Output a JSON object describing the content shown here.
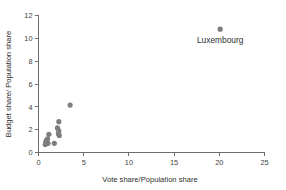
{
  "chart_data": {
    "type": "scatter",
    "title": "",
    "xlabel": "Vote share/Population share",
    "ylabel": "Budget share/ Population share",
    "xlim": [
      0,
      25
    ],
    "ylim": [
      0,
      12
    ],
    "xticks": [
      0,
      5,
      10,
      15,
      20,
      25
    ],
    "yticks": [
      0,
      2,
      4,
      6,
      8,
      10,
      12
    ],
    "xtick_labels": [
      "0",
      "5",
      "10",
      "15",
      "20",
      "25"
    ],
    "ytick_labels": [
      "0",
      "2",
      "4",
      "6",
      "8",
      "10",
      "12"
    ],
    "grid": false,
    "legend": "none",
    "marker_color": "#7d7d7d",
    "axis_color": "#6e6e6e",
    "background": "#ffffff",
    "points": [
      {
        "x": 20.1,
        "y": 10.8,
        "label": "Luxembourg"
      },
      {
        "x": 3.5,
        "y": 4.15,
        "label": ""
      },
      {
        "x": 2.25,
        "y": 2.7,
        "label": ""
      },
      {
        "x": 2.1,
        "y": 2.15,
        "label": ""
      },
      {
        "x": 2.25,
        "y": 1.9,
        "label": ""
      },
      {
        "x": 2.2,
        "y": 1.65,
        "label": ""
      },
      {
        "x": 2.3,
        "y": 1.5,
        "label": ""
      },
      {
        "x": 1.15,
        "y": 1.6,
        "label": ""
      },
      {
        "x": 1.0,
        "y": 1.2,
        "label": ""
      },
      {
        "x": 0.85,
        "y": 1.05,
        "label": ""
      },
      {
        "x": 0.8,
        "y": 0.85,
        "label": ""
      },
      {
        "x": 1.05,
        "y": 0.8,
        "label": ""
      },
      {
        "x": 0.75,
        "y": 0.7,
        "label": ""
      },
      {
        "x": 1.75,
        "y": 0.8,
        "label": ""
      }
    ],
    "annotations": [
      {
        "text": "Luxembourg",
        "x": 20.1,
        "y": 9.6
      }
    ]
  }
}
